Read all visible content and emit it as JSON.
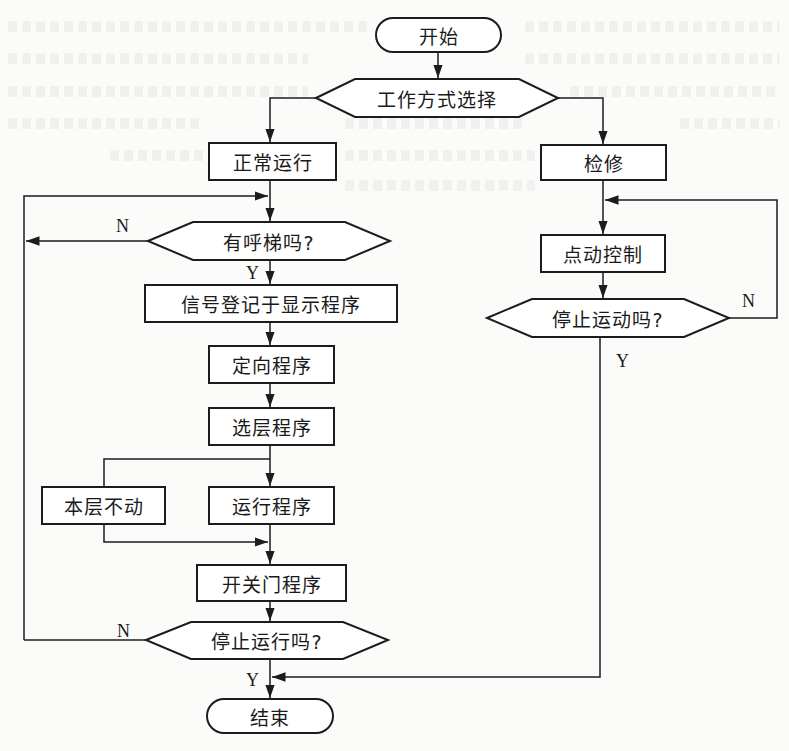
{
  "diagram": {
    "type": "flowchart",
    "nodes": {
      "start": {
        "label": "开始",
        "shape": "terminal"
      },
      "mode_select": {
        "label": "工作方式选择",
        "shape": "decision"
      },
      "normal_run": {
        "label": "正常运行",
        "shape": "process"
      },
      "maintenance": {
        "label": "检修",
        "shape": "process"
      },
      "has_call": {
        "label": "有呼梯吗?",
        "shape": "decision"
      },
      "signal_register": {
        "label": "信号登记于显示程序",
        "shape": "process"
      },
      "direction": {
        "label": "定向程序",
        "shape": "process"
      },
      "floor_select": {
        "label": "选层程序",
        "shape": "process"
      },
      "stay_floor": {
        "label": "本层不动",
        "shape": "process"
      },
      "run_program": {
        "label": "运行程序",
        "shape": "process"
      },
      "door_program": {
        "label": "开关门程序",
        "shape": "process"
      },
      "stop_running": {
        "label": "停止运行吗?",
        "shape": "decision"
      },
      "jog_control": {
        "label": "点动控制",
        "shape": "process"
      },
      "stop_motion": {
        "label": "停止运动吗?",
        "shape": "decision"
      },
      "end": {
        "label": "结束",
        "shape": "terminal"
      }
    },
    "branch_labels": {
      "has_call_no": "N",
      "has_call_yes": "Y",
      "stop_running_no": "N",
      "stop_running_yes": "Y",
      "stop_motion_no": "N",
      "stop_motion_yes": "Y"
    },
    "edges": [
      {
        "from": "start",
        "to": "mode_select"
      },
      {
        "from": "mode_select",
        "to": "normal_run"
      },
      {
        "from": "mode_select",
        "to": "maintenance"
      },
      {
        "from": "normal_run",
        "to": "has_call"
      },
      {
        "from": "has_call",
        "to": "signal_register",
        "label": "Y"
      },
      {
        "from": "has_call",
        "to": "has_call",
        "label": "N",
        "via": "left loop"
      },
      {
        "from": "signal_register",
        "to": "direction"
      },
      {
        "from": "direction",
        "to": "floor_select"
      },
      {
        "from": "floor_select",
        "to": "run_program"
      },
      {
        "from": "floor_select",
        "to": "stay_floor"
      },
      {
        "from": "run_program",
        "to": "door_program"
      },
      {
        "from": "stay_floor",
        "to": "door_program"
      },
      {
        "from": "door_program",
        "to": "stop_running"
      },
      {
        "from": "stop_running",
        "to": "end",
        "label": "Y"
      },
      {
        "from": "stop_running",
        "to": "has_call",
        "label": "N",
        "via": "left loop"
      },
      {
        "from": "maintenance",
        "to": "jog_control"
      },
      {
        "from": "jog_control",
        "to": "stop_motion"
      },
      {
        "from": "stop_motion",
        "to": "jog_control",
        "label": "N",
        "via": "right loop"
      },
      {
        "from": "stop_motion",
        "to": "end",
        "label": "Y"
      }
    ]
  },
  "colors": {
    "stroke": "#1c1c1c",
    "fill": "#ffffff",
    "background": "#fbfbfa"
  }
}
